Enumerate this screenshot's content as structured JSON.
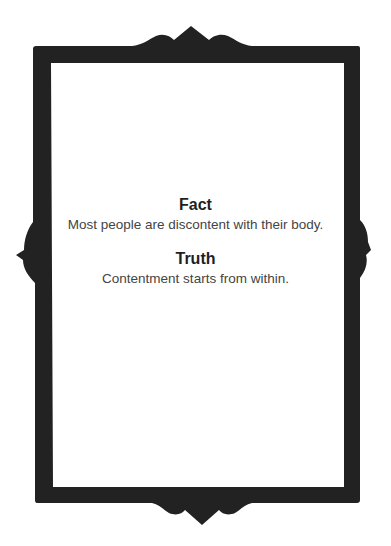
{
  "card": {
    "sections": [
      {
        "heading": "Fact",
        "text": "Most people are discontent with their body."
      },
      {
        "heading": "Truth",
        "text": "Contentment starts from within."
      }
    ],
    "frame_color": "#222222",
    "background_color": "#ffffff"
  }
}
